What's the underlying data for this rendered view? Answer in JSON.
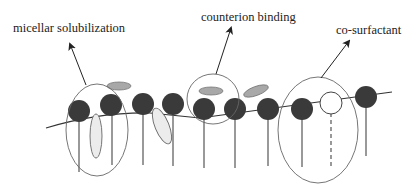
{
  "diagram": {
    "labels": {
      "micellar_solubilization": "micellar solubilization",
      "counterion_binding": "counterion binding",
      "co_surfactant": "co-surfactant"
    },
    "colors": {
      "surfactant_head": "#3a3a3a",
      "cosurfactant_head": "#ffffff",
      "counterion": "#a8a8a8",
      "solubilizate": "#ececec",
      "outline": "#555555",
      "line": "#333333"
    },
    "elements": {
      "surfactant_heads": 9,
      "cosurfactant_heads": 1,
      "counterions": 2,
      "solubilized_molecules": 2,
      "highlight_regions": 3
    }
  }
}
